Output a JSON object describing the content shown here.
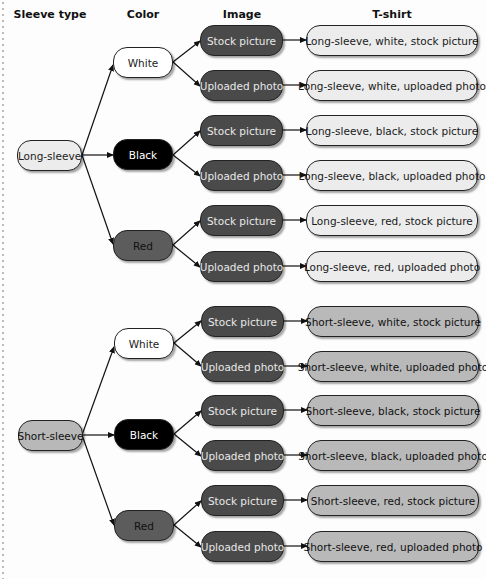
{
  "headers": {
    "sleeve_type": "Sleeve type",
    "color": "Color",
    "image": "Image",
    "tshirt": "T-shirt"
  },
  "sleeves": [
    {
      "label": "Long-sleeve",
      "fill": "#ececec"
    },
    {
      "label": "Short-sleeve",
      "fill": "#b8b8b8"
    }
  ],
  "colors": [
    {
      "label": "White",
      "fill": "#ffffff"
    },
    {
      "label": "Black",
      "fill": "#000000"
    },
    {
      "label": "Red",
      "fill": "#5c5c5c"
    }
  ],
  "images": [
    {
      "label": "Stock picture"
    },
    {
      "label": "Uploaded photo"
    }
  ],
  "tshirts": [
    "Long-sleeve, white, stock picture",
    "Long-sleeve, white, uploaded photo",
    "Long-sleeve, black, stock picture",
    "Long-sleeve, black, uploaded photo",
    "Long-sleeve, red, stock picture",
    "Long-sleeve, red, uploaded photo",
    "Short-sleeve, white, stock picture",
    "Short-sleeve, white, uploaded photo",
    "Short-sleeve, black, stock picture",
    "Short-sleeve, black, uploaded photo",
    "Short-sleeve, red, stock picture",
    "Short-sleeve, red, uploaded photo"
  ]
}
